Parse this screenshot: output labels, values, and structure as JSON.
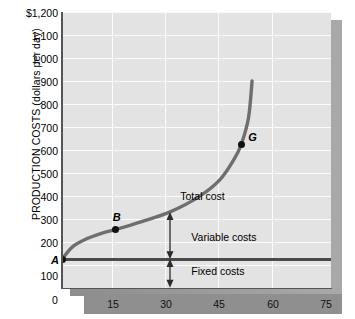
{
  "chart_data": {
    "type": "line",
    "title": "",
    "ylabel": "PRODUCTION COSTS (dollars per day)",
    "xlabel": "",
    "ylim": [
      0,
      1200
    ],
    "xlim": [
      0,
      75
    ],
    "ytick_labels": [
      "$1,200",
      "1,100",
      "1,000",
      "900",
      "800",
      "700",
      "600",
      "500",
      "400",
      "300",
      "200",
      "100"
    ],
    "ytick_values": [
      1200,
      1100,
      1000,
      900,
      800,
      700,
      600,
      500,
      400,
      300,
      200,
      100
    ],
    "xtick_labels": [
      "0",
      "15",
      "30",
      "45",
      "60",
      "75"
    ],
    "xtick_values": [
      0,
      15,
      30,
      45,
      60,
      75
    ],
    "grid": true,
    "legend": "none",
    "series": [
      {
        "name": "Total cost",
        "points": [
          {
            "x": 0,
            "y": 125
          },
          {
            "x": 3,
            "y": 180
          },
          {
            "x": 7,
            "y": 215
          },
          {
            "x": 11,
            "y": 238
          },
          {
            "x": 15,
            "y": 255
          },
          {
            "x": 22,
            "y": 288
          },
          {
            "x": 30,
            "y": 330
          },
          {
            "x": 38,
            "y": 395
          },
          {
            "x": 44,
            "y": 470
          },
          {
            "x": 48,
            "y": 560
          },
          {
            "x": 50,
            "y": 625
          },
          {
            "x": 52,
            "y": 740
          },
          {
            "x": 53,
            "y": 900
          }
        ]
      },
      {
        "name": "Fixed cost line",
        "points": [
          {
            "x": 0,
            "y": 125
          },
          {
            "x": 75,
            "y": 125
          }
        ]
      }
    ],
    "annotations": [
      {
        "name": "point-a",
        "label": "A",
        "x": 0,
        "y": 125
      },
      {
        "name": "point-b",
        "label": "B",
        "x": 15,
        "y": 255
      },
      {
        "name": "point-g",
        "label": "G",
        "x": 50,
        "y": 625
      },
      {
        "name": "curve-label",
        "label": "Total cost",
        "x": 38,
        "y": 390
      },
      {
        "name": "variable-costs-label",
        "label": "Variable costs",
        "x": 33,
        "y": 215
      },
      {
        "name": "fixed-costs-label",
        "label": "Fixed costs",
        "x": 33,
        "y": 65
      }
    ],
    "arrows": [
      {
        "name": "variable-costs-arrow",
        "x": 30,
        "y_from": 125,
        "y_to": 330
      },
      {
        "name": "fixed-costs-arrow",
        "x": 30,
        "y_from": 0,
        "y_to": 125
      }
    ]
  },
  "colors": {
    "plot_background": "#e3e3e3",
    "gridline": "#fbfbfb",
    "curve": "#6e6e6e",
    "fixed_line": "#4a4a4a",
    "axis": "#555555",
    "band": "#8f8f8f",
    "shadow": "#9a9a9a",
    "text": "#000000"
  }
}
